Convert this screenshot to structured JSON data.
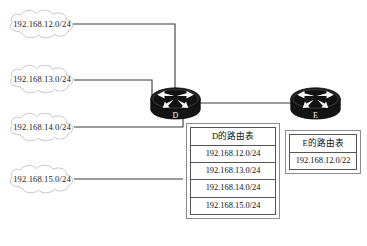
{
  "diagram": {
    "background_color": "#ffffff",
    "line_color": "#3b3b3b",
    "clouds": [
      {
        "id": "cloud-12",
        "label": "192.168.12.0/24"
      },
      {
        "id": "cloud-13",
        "label": "192.168.13.0/24"
      },
      {
        "id": "cloud-14",
        "label": "192.168.14.0/24"
      },
      {
        "id": "cloud-15",
        "label": "192.168.15.0/24"
      }
    ],
    "routers": [
      {
        "id": "router-d",
        "label": "D"
      },
      {
        "id": "router-e",
        "label": "E"
      }
    ],
    "links": [
      {
        "from": "cloud-12",
        "to": "router-d"
      },
      {
        "from": "cloud-13",
        "to": "router-d"
      },
      {
        "from": "cloud-14",
        "to": "router-d"
      },
      {
        "from": "cloud-15",
        "to": "router-d"
      },
      {
        "from": "router-d",
        "to": "router-e"
      }
    ]
  },
  "routing_table_d": {
    "header": "D的路由表",
    "rows": [
      "192.168.12.0/24",
      "192.168.13.0/24",
      "192.168.14.0/24",
      "192.168.15.0/24"
    ]
  },
  "routing_table_e": {
    "header": "E的路由表",
    "rows": [
      "192.168.12.0/22"
    ]
  }
}
